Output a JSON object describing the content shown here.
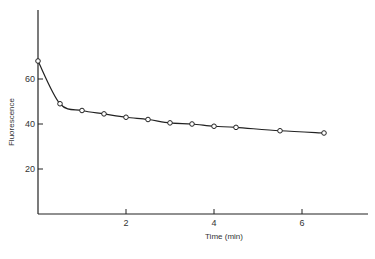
{
  "chart_data": {
    "type": "line",
    "title": "",
    "xlabel": "Time (min)",
    "ylabel": "Fluorescence",
    "xlim": [
      0,
      7.5
    ],
    "ylim": [
      0,
      80
    ],
    "x_ticks": [
      2,
      4,
      6
    ],
    "y_ticks": [
      20,
      40,
      60
    ],
    "grid": false,
    "legend": null,
    "series": [
      {
        "name": "Fluorescence",
        "marker": "open-circle",
        "x": [
          0,
          0.5,
          1.0,
          1.5,
          2.0,
          2.5,
          3.0,
          3.5,
          4.0,
          4.5,
          5.5,
          6.5
        ],
        "values": [
          68,
          49,
          46,
          44.5,
          43,
          42,
          40.5,
          40,
          39,
          38.5,
          37,
          36
        ]
      }
    ]
  },
  "labels": {
    "x_axis_title": "Time (min)",
    "y_axis_title": "Fluorescence",
    "x_tick_labels": [
      "2",
      "4",
      "6"
    ],
    "y_tick_labels": [
      "20",
      "40",
      "60"
    ]
  }
}
